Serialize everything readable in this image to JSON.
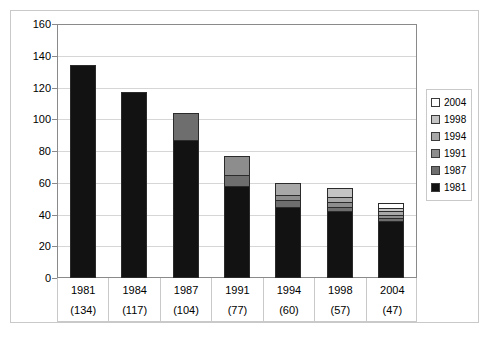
{
  "chart_data": {
    "type": "bar",
    "title": "",
    "xlabel": "",
    "ylabel": "",
    "ylim": [
      0,
      160
    ],
    "ytick_step": 20,
    "yticks": [
      160,
      140,
      120,
      100,
      80,
      60,
      40,
      20,
      0
    ],
    "grid": true,
    "stacked": true,
    "legend_position": "right",
    "categories": [
      "1981",
      "1984",
      "1987",
      "1991",
      "1994",
      "1998",
      "2004"
    ],
    "category_totals": [
      "(134)",
      "(117)",
      "(104)",
      "(77)",
      "(60)",
      "(57)",
      "(47)"
    ],
    "totals": [
      134,
      117,
      104,
      77,
      60,
      57,
      47
    ],
    "series": [
      {
        "name": "1981",
        "color": "#121212",
        "values": [
          134,
          117,
          87,
          58,
          45,
          42,
          36
        ]
      },
      {
        "name": "1987",
        "color": "#6e6e6e",
        "values": [
          0,
          0,
          17,
          7,
          4,
          3,
          2
        ]
      },
      {
        "name": "1991",
        "color": "#8d8d8d",
        "values": [
          0,
          0,
          0,
          12,
          3,
          3,
          2
        ]
      },
      {
        "name": "1994",
        "color": "#a8a8a8",
        "values": [
          0,
          0,
          0,
          0,
          8,
          3,
          2
        ]
      },
      {
        "name": "1998",
        "color": "#c4c4c4",
        "values": [
          0,
          0,
          0,
          0,
          0,
          6,
          2
        ]
      },
      {
        "name": "2004",
        "color": "#ffffff",
        "values": [
          0,
          0,
          0,
          0,
          0,
          0,
          3
        ]
      }
    ],
    "legend_entries": [
      {
        "label": "2004",
        "color": "#ffffff"
      },
      {
        "label": "1998",
        "color": "#c4c4c4"
      },
      {
        "label": "1994",
        "color": "#a8a8a8"
      },
      {
        "label": "1991",
        "color": "#8d8d8d"
      },
      {
        "label": "1987",
        "color": "#6e6e6e"
      },
      {
        "label": "1981",
        "color": "#121212"
      }
    ]
  },
  "axis": {
    "y_labels": [
      "160",
      "140",
      "120",
      "100",
      "80",
      "60",
      "40",
      "20",
      "0"
    ],
    "zero_label": "0"
  },
  "xaxis": {
    "columns": [
      {
        "year": "1981",
        "count": "(134)"
      },
      {
        "year": "1984",
        "count": "(117)"
      },
      {
        "year": "1987",
        "count": "(104)"
      },
      {
        "year": "1991",
        "count": "(77)"
      },
      {
        "year": "1994",
        "count": "(60)"
      },
      {
        "year": "1998",
        "count": "(57)"
      },
      {
        "year": "2004",
        "count": "(47)"
      }
    ]
  },
  "header": {
    "cut_text": ""
  }
}
